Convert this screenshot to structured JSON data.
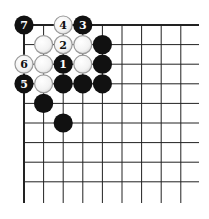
{
  "diagram": {
    "type": "go-board-corner",
    "grid": {
      "columns": 9,
      "rows": 9,
      "origin_x": 24,
      "origin_y": 25,
      "spacing": 19.6,
      "line_extend_right": 199,
      "line_extend_bottom": 203,
      "line_color": "#222222",
      "edge_width": 2,
      "inner_width": 1
    },
    "colors": {
      "black_stone": "#111111",
      "white_stone_fill": "#f4f4f4",
      "white_stone_border": "#9a9a9a",
      "label_on_black": "#ffffff",
      "label_on_white": "#111111"
    },
    "stones": [
      {
        "color": "black",
        "col": 0,
        "row": 0,
        "label": "7"
      },
      {
        "color": "white",
        "col": 2,
        "row": 0,
        "label": "4"
      },
      {
        "color": "black",
        "col": 3,
        "row": 0,
        "label": "3"
      },
      {
        "color": "white",
        "col": 1,
        "row": 1,
        "label": ""
      },
      {
        "color": "white",
        "col": 2,
        "row": 1,
        "label": "2"
      },
      {
        "color": "white",
        "col": 3,
        "row": 1,
        "label": ""
      },
      {
        "color": "black",
        "col": 4,
        "row": 1,
        "label": ""
      },
      {
        "color": "white",
        "col": 0,
        "row": 2,
        "label": "6"
      },
      {
        "color": "white",
        "col": 1,
        "row": 2,
        "label": ""
      },
      {
        "color": "black",
        "col": 2,
        "row": 2,
        "label": "1"
      },
      {
        "color": "white",
        "col": 3,
        "row": 2,
        "label": ""
      },
      {
        "color": "black",
        "col": 4,
        "row": 2,
        "label": ""
      },
      {
        "color": "black",
        "col": 0,
        "row": 3,
        "label": "5"
      },
      {
        "color": "white",
        "col": 1,
        "row": 3,
        "label": ""
      },
      {
        "color": "black",
        "col": 2,
        "row": 3,
        "label": ""
      },
      {
        "color": "black",
        "col": 3,
        "row": 3,
        "label": ""
      },
      {
        "color": "black",
        "col": 4,
        "row": 3,
        "label": ""
      },
      {
        "color": "black",
        "col": 1,
        "row": 4,
        "label": ""
      },
      {
        "color": "black",
        "col": 2,
        "row": 5,
        "label": ""
      }
    ]
  }
}
